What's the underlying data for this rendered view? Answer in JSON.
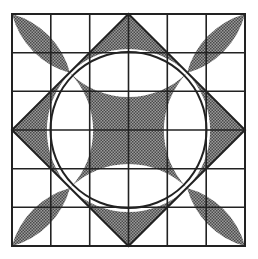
{
  "figure": {
    "grid": {
      "cols": 6,
      "rows": 6,
      "x0": 12,
      "y0": 14,
      "x1": 245,
      "y1": 246
    },
    "colors": {
      "line": "#222222",
      "shade": "#7a7a7a",
      "background": "#ffffff"
    },
    "center": [
      128.5,
      130
    ],
    "arc_radius": 83
  }
}
